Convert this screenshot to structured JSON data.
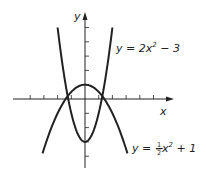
{
  "chart_data": {
    "type": "line",
    "title": "",
    "xlabel": "x",
    "ylabel": "y",
    "xlim": [
      -5,
      6
    ],
    "ylim": [
      -5,
      6
    ],
    "grid": false,
    "x_ticks": [
      -4,
      -3,
      -2,
      -1,
      1,
      2,
      3,
      4,
      5
    ],
    "y_ticks": [
      -4,
      -3,
      -2,
      -1,
      1,
      2,
      3,
      4,
      5
    ],
    "series": [
      {
        "name": "y = 2x² − 3",
        "equation": "2x^2 - 3",
        "x_range": [
          -2,
          2
        ],
        "x": [
          -2,
          -1.5,
          -1,
          -0.5,
          0,
          0.5,
          1,
          1.5,
          2
        ],
        "values": [
          5,
          1.5,
          -1,
          -2.5,
          -3,
          -2.5,
          -1,
          1.5,
          5
        ]
      },
      {
        "name": "y = −½x² + 1",
        "equation": "-0.5x^2 + 1",
        "x_range": [
          -3.1,
          3.1
        ],
        "x": [
          -3,
          -2,
          -1,
          0,
          1,
          2,
          3
        ],
        "values": [
          -3.5,
          -1,
          0.5,
          1,
          0.5,
          -1,
          -3.5
        ]
      }
    ],
    "annotations": [
      {
        "text": "y = 2x² − 3",
        "near_series": 0
      },
      {
        "text": "y = −½x² + 1",
        "near_series": 1
      }
    ]
  },
  "labels": {
    "x_axis": "x",
    "y_axis": "y",
    "curve1": {
      "prefix": "y = 2x",
      "sup": "2",
      "suffix": " − 3"
    },
    "curve2": {
      "prefix": "y = −",
      "num": "1",
      "den": "2",
      "mid": "x",
      "sup": "2",
      "suffix": " + 1"
    }
  },
  "colors": {
    "ink": "#222222",
    "background": "#ffffff"
  }
}
